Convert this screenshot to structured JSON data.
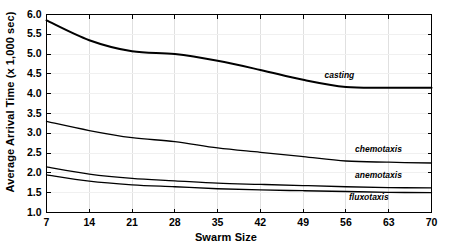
{
  "chart_data": {
    "type": "line",
    "title": "",
    "xlabel": "Swarm Size",
    "ylabel": "Average Arrival Time (x 1,000 sec)",
    "xlim": [
      7,
      70
    ],
    "ylim": [
      1.0,
      6.0
    ],
    "xticks": [
      7,
      14,
      21,
      28,
      35,
      42,
      49,
      56,
      63,
      70
    ],
    "yticks": [
      1.0,
      1.5,
      2.0,
      2.5,
      3.0,
      3.5,
      4.0,
      4.5,
      5.0,
      5.5,
      6.0
    ],
    "xtick_labels": [
      "7",
      "14",
      "21",
      "28",
      "35",
      "42",
      "49",
      "56",
      "63",
      "70"
    ],
    "ytick_labels": [
      "1.0",
      "1.5",
      "2.0",
      "2.5",
      "3.0",
      "3.5",
      "4.0",
      "4.5",
      "5.0",
      "5.5",
      "6.0"
    ],
    "grid": true,
    "grid_color": "#e0e0e0",
    "legend_position": "inline-right",
    "line_color": "#000000",
    "x": [
      7,
      14,
      21,
      28,
      35,
      42,
      49,
      56,
      63,
      70
    ],
    "series": [
      {
        "name": "casting",
        "label": "casting",
        "values": [
          5.85,
          5.35,
          5.07,
          5.0,
          4.83,
          4.6,
          4.35,
          4.17,
          4.15,
          4.15
        ],
        "line_width": 2.0
      },
      {
        "name": "chemotaxis",
        "label": "chemotaxis",
        "values": [
          3.3,
          3.07,
          2.89,
          2.79,
          2.63,
          2.52,
          2.41,
          2.3,
          2.27,
          2.25
        ],
        "line_width": 1.3
      },
      {
        "name": "anemotaxis",
        "label": "anemotaxis",
        "values": [
          2.15,
          1.97,
          1.86,
          1.8,
          1.74,
          1.71,
          1.68,
          1.65,
          1.63,
          1.62
        ],
        "line_width": 1.3
      },
      {
        "name": "fluxotaxis",
        "label": "fluxotaxis",
        "values": [
          1.95,
          1.79,
          1.7,
          1.65,
          1.6,
          1.57,
          1.55,
          1.53,
          1.51,
          1.5
        ],
        "line_width": 1.3
      }
    ],
    "annotations": [
      {
        "text": "casting",
        "x": 52.5,
        "y": 4.44
      },
      {
        "text": "chemotaxis",
        "x": 57.5,
        "y": 2.59
      },
      {
        "text": "anemotaxis",
        "x": 57.5,
        "y": 1.93
      },
      {
        "text": "fluxotaxis",
        "x": 56.5,
        "y": 1.37
      }
    ]
  }
}
